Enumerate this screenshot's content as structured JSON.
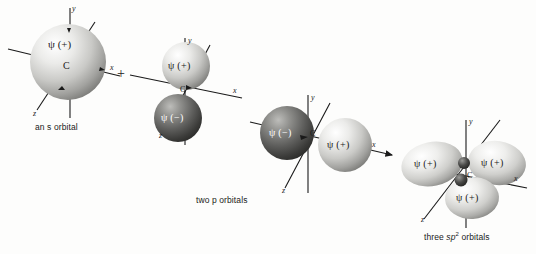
{
  "figure": {
    "kind": "orbital-hybridization-diagram",
    "background_color": "#fdfdfc",
    "ink_color": "#1a1a1a",
    "operator": "+",
    "captions": {
      "s_orbital": "an s orbital",
      "p_orbitals": "two p orbitals",
      "sp2_orbitals": "three sp2 orbitals",
      "sp2_orbitals_prefix": "three ",
      "sp2_orbitals_sp": "sp",
      "sp2_orbitals_exp": "2",
      "sp2_orbitals_suffix": " orbitals"
    }
  },
  "s_orbital": {
    "name": "s orbital",
    "center_label": "C",
    "wave_label": "ψ (+)",
    "sphere_color_light": "#f2f2f0",
    "sphere_color_dark": "#8a8a88",
    "axes": [
      {
        "label": "y",
        "direction": "up"
      },
      {
        "label": "x",
        "direction": "right"
      },
      {
        "label": "z",
        "direction": "down-left"
      }
    ]
  },
  "p_orbital_vertical": {
    "name": "p orbital along y",
    "center_label": "C",
    "lobes": [
      {
        "label": "ψ (+)",
        "sign": "+",
        "position": "upper",
        "shade": "light"
      },
      {
        "label": "ψ (−)",
        "sign": "-",
        "position": "lower",
        "shade": "dark"
      }
    ],
    "axes": [
      {
        "label": "y",
        "direction": "up"
      },
      {
        "label": "x",
        "direction": "right"
      },
      {
        "label": "z",
        "direction": "down-left"
      }
    ]
  },
  "p_orbital_horizontal": {
    "name": "p orbital along x",
    "center_label": "C",
    "lobes": [
      {
        "label": "ψ (−)",
        "sign": "-",
        "position": "left",
        "shade": "dark"
      },
      {
        "label": "ψ (+)",
        "sign": "+",
        "position": "right",
        "shade": "light"
      }
    ],
    "axes": [
      {
        "label": "y",
        "direction": "up"
      },
      {
        "label": "x",
        "direction": "right"
      },
      {
        "label": "z",
        "direction": "down-left"
      }
    ]
  },
  "arrow": {
    "name": "transformation arrow",
    "direction": "right"
  },
  "sp2_orbitals": {
    "name": "three sp2 hybrid orbitals",
    "center_label": "C",
    "lobes": [
      {
        "label": "ψ (+)",
        "sign": "+",
        "position": "left"
      },
      {
        "label": "ψ (+)",
        "sign": "+",
        "position": "upper-right"
      },
      {
        "label": "ψ (+)",
        "sign": "+",
        "position": "lower-center"
      }
    ],
    "axes": [
      {
        "label": "y",
        "direction": "up"
      },
      {
        "label": "x",
        "direction": "right"
      },
      {
        "label": "z",
        "direction": "down-left"
      }
    ]
  }
}
